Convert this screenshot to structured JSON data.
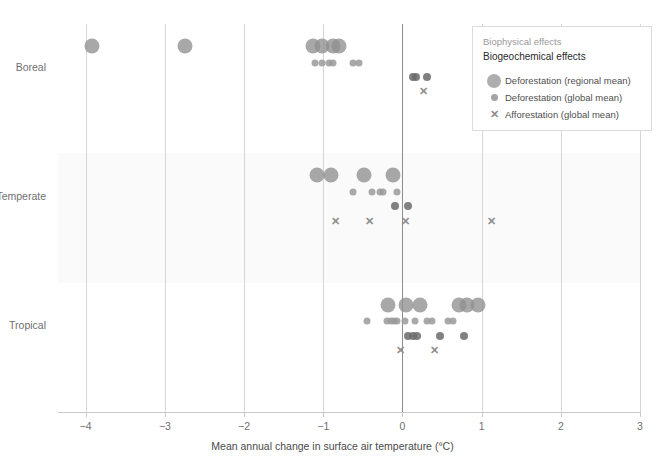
{
  "chart_data": {
    "type": "scatter",
    "title": "",
    "xlabel": "Mean annual change in surface air temperature (°C)",
    "ylabel": "",
    "xlim": [
      -4.35,
      3.0
    ],
    "xticks": [
      -4,
      -3,
      -2,
      -1,
      0,
      1,
      2,
      3
    ],
    "xticklabels": [
      "−4",
      "−3",
      "−2",
      "−1",
      "0",
      "1",
      "2",
      "3"
    ],
    "categories": [
      "Boreal",
      "Temperate",
      "Tropical"
    ],
    "grid": "vertical",
    "zero_line": 0,
    "legend_position": "top-right",
    "series": [
      {
        "name": "Deforestation (regional mean)",
        "marker": "circle-large",
        "color": "#8f8f8f",
        "points": [
          {
            "category": "Boreal",
            "x": -3.92
          },
          {
            "category": "Boreal",
            "x": -2.74
          },
          {
            "category": "Boreal",
            "x": -1.13
          },
          {
            "category": "Boreal",
            "x": -1.02
          },
          {
            "category": "Boreal",
            "x": -0.88
          },
          {
            "category": "Boreal",
            "x": -0.8
          },
          {
            "category": "Temperate",
            "x": -1.08
          },
          {
            "category": "Temperate",
            "x": -0.9
          },
          {
            "category": "Temperate",
            "x": -0.48
          },
          {
            "category": "Temperate",
            "x": -0.12
          },
          {
            "category": "Tropical",
            "x": -0.18
          },
          {
            "category": "Tropical",
            "x": 0.05
          },
          {
            "category": "Tropical",
            "x": 0.22
          },
          {
            "category": "Tropical",
            "x": 0.72
          },
          {
            "category": "Tropical",
            "x": 0.82
          },
          {
            "category": "Tropical",
            "x": 0.96
          }
        ]
      },
      {
        "name": "Deforestation (global mean)",
        "marker": "circle-small",
        "color": "#9a9a9a",
        "points": [
          {
            "category": "Boreal",
            "x": -1.1
          },
          {
            "category": "Boreal",
            "x": -1.02
          },
          {
            "category": "Boreal",
            "x": -0.93
          },
          {
            "category": "Boreal",
            "x": -0.88
          },
          {
            "category": "Boreal",
            "x": -0.62
          },
          {
            "category": "Boreal",
            "x": -0.55
          },
          {
            "category": "Temperate",
            "x": -0.63
          },
          {
            "category": "Temperate",
            "x": -0.38
          },
          {
            "category": "Temperate",
            "x": -0.28
          },
          {
            "category": "Temperate",
            "x": -0.24
          },
          {
            "category": "Temperate",
            "x": -0.07
          },
          {
            "category": "Tropical",
            "x": -0.45
          },
          {
            "category": "Tropical",
            "x": -0.2
          },
          {
            "category": "Tropical",
            "x": -0.15
          },
          {
            "category": "Tropical",
            "x": -0.11
          },
          {
            "category": "Tropical",
            "x": -0.07
          },
          {
            "category": "Tropical",
            "x": 0.03
          },
          {
            "category": "Tropical",
            "x": 0.16
          },
          {
            "category": "Tropical",
            "x": 0.31
          },
          {
            "category": "Tropical",
            "x": 0.37
          },
          {
            "category": "Tropical",
            "x": 0.58
          },
          {
            "category": "Tropical",
            "x": 0.64
          }
        ]
      },
      {
        "name": "Deforestation (global mean) – biogeochemical",
        "marker": "circle-small-dark",
        "color": "#6b6b6b",
        "points": [
          {
            "category": "Boreal",
            "x": 0.13
          },
          {
            "category": "Boreal",
            "x": 0.17
          },
          {
            "category": "Boreal",
            "x": 0.31
          },
          {
            "category": "Temperate",
            "x": -0.1
          },
          {
            "category": "Temperate",
            "x": 0.07
          },
          {
            "category": "Tropical",
            "x": 0.07
          },
          {
            "category": "Tropical",
            "x": 0.13
          },
          {
            "category": "Tropical",
            "x": 0.19
          },
          {
            "category": "Tropical",
            "x": 0.47
          },
          {
            "category": "Tropical",
            "x": 0.78
          }
        ]
      },
      {
        "name": "Afforestation (global mean)",
        "marker": "x",
        "color": "#8f8f8f",
        "points": [
          {
            "category": "Boreal",
            "x": 0.27
          },
          {
            "category": "Temperate",
            "x": -0.85
          },
          {
            "category": "Temperate",
            "x": -0.42
          },
          {
            "category": "Temperate",
            "x": 0.04
          },
          {
            "category": "Temperate",
            "x": 1.12
          },
          {
            "category": "Tropical",
            "x": -0.02
          },
          {
            "category": "Tropical",
            "x": 0.4
          }
        ]
      }
    ]
  },
  "legend": {
    "heading_biophysical": "Biophysical effects",
    "heading_biogeochemical": "Biogeochemical effects",
    "items": [
      {
        "label": "Deforestation (regional mean)",
        "marker": "circle-large"
      },
      {
        "label": "Deforestation (global mean)",
        "marker": "circle-small"
      },
      {
        "label": "Afforestation (global mean)",
        "marker": "x"
      }
    ]
  },
  "colors": {
    "dot_light": "#8f8f8f",
    "dot_dark": "#6b6b6b",
    "gridline": "#d6d6d6",
    "zero_line": "#8d8d8d",
    "band": "#fafafa",
    "text_muted": "#6f6f6f",
    "text_dark": "#2b2b2b"
  },
  "top_cut_text": ""
}
